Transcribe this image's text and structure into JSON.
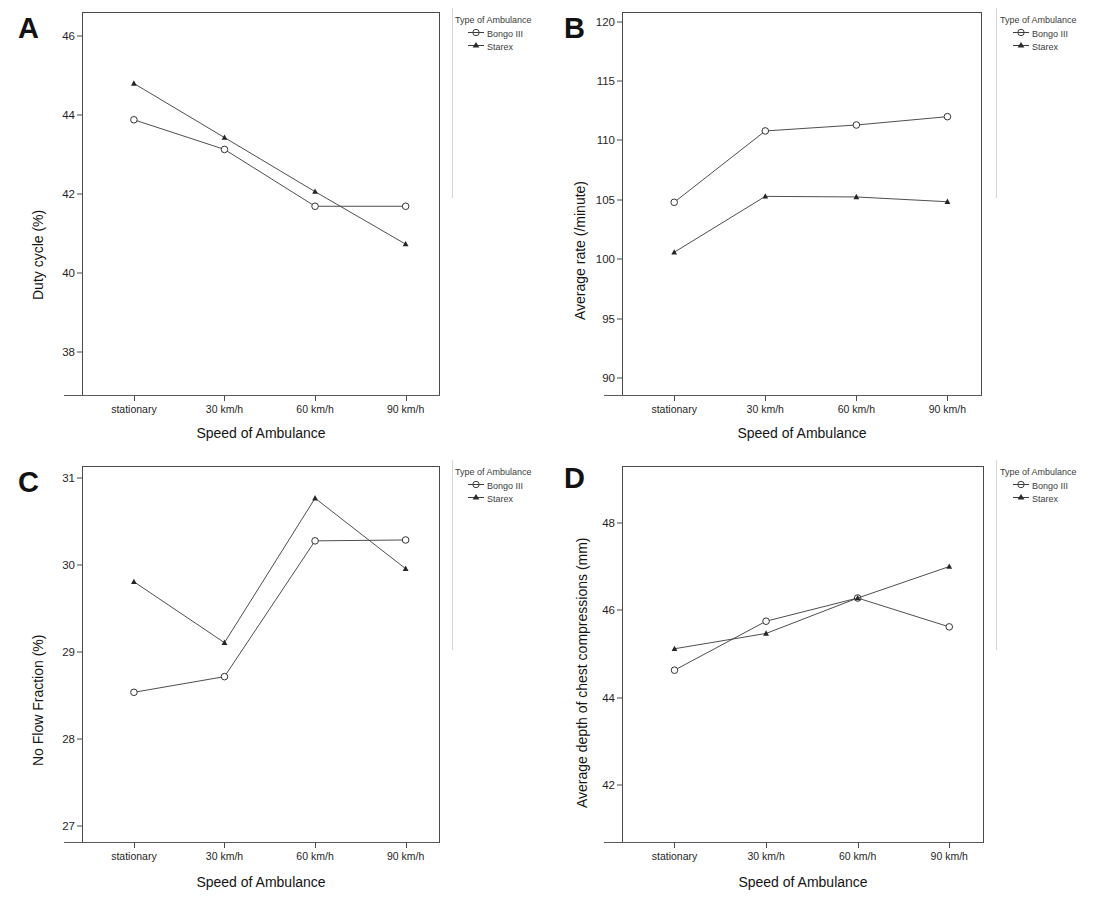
{
  "figure": {
    "xlabel": "Speed of Ambulance",
    "categories": [
      "stationary",
      "30 km/h",
      "60 km/h",
      "90 km/h"
    ],
    "legend_title": "Type of Ambulance",
    "series_names": [
      "Bongo III",
      "Starex"
    ],
    "marker_bongo": "open-circle-with-line-icon",
    "marker_starex": "filled-triangle-with-line-icon"
  },
  "panels": [
    {
      "letter": "A",
      "ylabel": "Duty cycle (%)",
      "xlabel": "Speed of Ambulance",
      "yticks": [
        "46",
        "44",
        "42",
        "40",
        "38"
      ]
    },
    {
      "letter": "B",
      "ylabel": "Average rate (/minute)",
      "xlabel": "Speed of Ambulance",
      "yticks": [
        "120",
        "115",
        "110",
        "105",
        "100",
        "95",
        "90"
      ]
    },
    {
      "letter": "C",
      "ylabel": "No Flow Fraction (%)",
      "xlabel": "Speed of Ambulance",
      "yticks": [
        "31",
        "30",
        "29",
        "28",
        "27"
      ]
    },
    {
      "letter": "D",
      "ylabel": "Average depth of chest compressions (mm)",
      "xlabel": "Speed of Ambulance",
      "yticks": [
        "48",
        "46",
        "44",
        "42"
      ]
    }
  ],
  "chart_data": [
    {
      "type": "line",
      "panel": "A",
      "title": "",
      "xlabel": "Speed of Ambulance",
      "ylabel": "Duty cycle (%)",
      "categories": [
        "stationary",
        "30 km/h",
        "60 km/h",
        "90 km/h"
      ],
      "ytick_values": [
        46,
        44,
        42,
        40,
        38
      ],
      "ylim": [
        36.9,
        46.6
      ],
      "grid": false,
      "legend_position": "right-top",
      "series": [
        {
          "name": "Bongo III",
          "marker": "open-circle",
          "values": [
            43.87,
            43.12,
            41.68,
            41.68
          ]
        },
        {
          "name": "Starex",
          "marker": "filled-triangle",
          "values": [
            44.79,
            43.42,
            42.05,
            40.72
          ]
        }
      ]
    },
    {
      "type": "line",
      "panel": "B",
      "title": "",
      "xlabel": "Speed of Ambulance",
      "ylabel": "Average rate (/minute)",
      "categories": [
        "stationary",
        "30 km/h",
        "60 km/h",
        "90 km/h"
      ],
      "ytick_values": [
        120,
        115,
        110,
        105,
        100,
        95,
        90
      ],
      "ylim": [
        88.6,
        120.8
      ],
      "grid": false,
      "legend_position": "right-top",
      "series": [
        {
          "name": "Bongo III",
          "marker": "open-circle",
          "values": [
            104.8,
            110.8,
            111.3,
            112.0
          ]
        },
        {
          "name": "Starex",
          "marker": "filled-triangle",
          "values": [
            100.6,
            105.3,
            105.25,
            104.85
          ]
        }
      ]
    },
    {
      "type": "line",
      "panel": "C",
      "title": "",
      "xlabel": "Speed of Ambulance",
      "ylabel": "No Flow Fraction (%)",
      "categories": [
        "stationary",
        "30 km/h",
        "60 km/h",
        "90 km/h"
      ],
      "ytick_values": [
        31,
        30,
        29,
        28,
        27
      ],
      "ylim": [
        26.82,
        31.14
      ],
      "grid": false,
      "legend_position": "right-top",
      "series": [
        {
          "name": "Bongo III",
          "marker": "open-circle",
          "values": [
            28.54,
            28.72,
            30.28,
            30.29
          ]
        },
        {
          "name": "Starex",
          "marker": "filled-triangle",
          "values": [
            29.81,
            29.11,
            30.77,
            29.96
          ]
        }
      ]
    },
    {
      "type": "line",
      "panel": "D",
      "title": "",
      "xlabel": "Speed of Ambulance",
      "ylabel": "Average depth of chest compressions (mm)",
      "categories": [
        "stationary",
        "30 km/h",
        "60 km/h",
        "90 km/h"
      ],
      "ytick_values": [
        48,
        46,
        44,
        42
      ],
      "ylim": [
        40.7,
        49.3
      ],
      "grid": false,
      "legend_position": "right-top",
      "series": [
        {
          "name": "Bongo III",
          "marker": "open-circle",
          "values": [
            44.63,
            45.75,
            46.28,
            45.62
          ]
        },
        {
          "name": "Starex",
          "marker": "filled-triangle",
          "values": [
            45.12,
            45.47,
            46.28,
            47.0
          ]
        }
      ]
    }
  ]
}
